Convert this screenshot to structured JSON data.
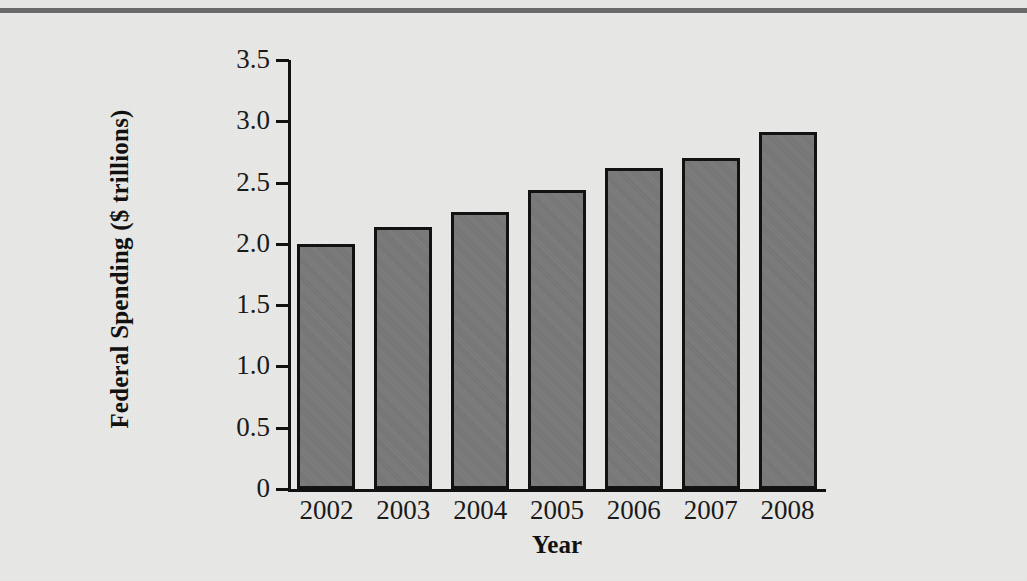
{
  "figure": {
    "background_color": "#e9e9e7",
    "top_rule_color": "#6a6a6a"
  },
  "chart_data": {
    "type": "bar",
    "title": "",
    "subtitle": "",
    "xlabel": "Year",
    "ylabel": "Federal Spending ($ trillions)",
    "categories": [
      "2002",
      "2003",
      "2004",
      "2005",
      "2006",
      "2007",
      "2008"
    ],
    "values": [
      2.0,
      2.14,
      2.26,
      2.44,
      2.62,
      2.7,
      2.91
    ],
    "series": [
      {
        "name": "Federal Spending",
        "values": [
          2.0,
          2.14,
          2.26,
          2.44,
          2.62,
          2.7,
          2.91
        ]
      }
    ],
    "ylim": [
      0,
      3.5
    ],
    "ytick_values": [
      0,
      0.5,
      1.0,
      1.5,
      2.0,
      2.5,
      3.0,
      3.5
    ],
    "ytick_labels": [
      "0",
      "0.5",
      "1.0",
      "1.5",
      "2.0",
      "2.5",
      "3.0",
      "3.5"
    ],
    "grid": false,
    "legend": null,
    "legend_position": "none",
    "bar_fill_color": "#787878",
    "bar_edge_color": "#121212",
    "axis_color": "#111111"
  }
}
